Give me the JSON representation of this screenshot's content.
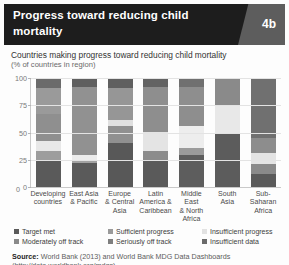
{
  "header": {
    "title": "Progress toward reducing child mortality",
    "badge": "4b"
  },
  "subtitle": {
    "main": "Countries making progress toward reducing child mortality",
    "sub": "(% of countries in region)"
  },
  "source": {
    "label": "Source:",
    "text": " World Bank (2013) and World Bank MDG Data Dashboards",
    "url": "(http://data.worldbank.org/mdgs)."
  },
  "colors": {
    "target_met": "#5a5a5a",
    "sufficient_progress": "#9a9a9a",
    "insufficient_progress": "#e8e8e8",
    "moderately_off_track": "#8a8a8a",
    "seriously_off_track": "#7e7e7e",
    "insufficient_data": "#6b6b6b",
    "header_bg": "#1d1d1d",
    "header_wedge": "#5d5d5d",
    "grid": "#e3e3e3"
  },
  "legend": [
    {
      "label": "Target met",
      "color": "#5a5a5a"
    },
    {
      "label": "Sufficient progress",
      "color": "#9a9a9a"
    },
    {
      "label": "Insufficient progress",
      "color": "#e2e2e2"
    },
    {
      "label": "Moderately off track",
      "color": "#8a8a8a"
    },
    {
      "label": "Seriously off track",
      "color": "#7e7e7e"
    },
    {
      "label": "Insufficient data",
      "color": "#6b6b6b"
    }
  ],
  "chart_data": {
    "type": "bar",
    "subtype": "stacked-bar-100",
    "title": "Countries making progress toward reducing child mortality",
    "xlabel": "",
    "ylabel": "% of countries in region",
    "ylim": [
      0,
      100
    ],
    "yticks": [
      0,
      25,
      50,
      75,
      100
    ],
    "grid": true,
    "legend_position": "bottom",
    "categories": [
      "Developing countries",
      "East Asia & Pacific",
      "Europe & Central Asia",
      "Latin America & Caribbean",
      "Middle East & North Africa",
      "South Asia",
      "Sub-Saharan Africa"
    ],
    "category_lines": [
      [
        "Developing",
        "countries"
      ],
      [
        "East Asia",
        "& Pacific"
      ],
      [
        "Europe",
        "& Central",
        "Asia"
      ],
      [
        "Latin",
        "America &",
        "Caribbean"
      ],
      [
        "Middle East",
        "& North",
        "Africa"
      ],
      [
        "South",
        "Asia"
      ],
      [
        "Sub-Saharan",
        "Africa"
      ]
    ],
    "series": [
      {
        "name": "Target met",
        "color": "#5a5a5a",
        "values": [
          25,
          22,
          40,
          24,
          29,
          50,
          12
        ]
      },
      {
        "name": "Seriously off track",
        "color": "#7e7e7e",
        "values": [
          8,
          3,
          16,
          9,
          7,
          0,
          9
        ]
      },
      {
        "name": "Insufficient progress",
        "color": "#e2e2e2",
        "values": [
          9,
          4,
          5,
          17,
          20,
          25,
          10
        ]
      },
      {
        "name": "Moderately off track",
        "color": "#8a8a8a",
        "values": [
          25,
          0,
          30,
          0,
          0,
          0,
          14
        ]
      },
      {
        "name": "Sufficient progress",
        "color": "#9a9a9a",
        "values": [
          24,
          63,
          0,
          42,
          36,
          25,
          0
        ]
      },
      {
        "name": "Insufficient data",
        "color": "#6b6b6b",
        "values": [
          9,
          8,
          9,
          8,
          8,
          0,
          55
        ]
      }
    ],
    "stacks": [
      {
        "category": "Developing countries",
        "segments": [
          {
            "name": "Insufficient data",
            "value": 9,
            "color": "#6b6b6b"
          },
          {
            "name": "Sufficient progress",
            "value": 24,
            "color": "#9a9a9a"
          },
          {
            "name": "Moderately off track",
            "value": 25,
            "color": "#8f8f8f"
          },
          {
            "name": "Insufficient progress",
            "value": 9,
            "color": "#e8e8e8"
          },
          {
            "name": "Seriously off track",
            "value": 8,
            "color": "#9d9d9d"
          },
          {
            "name": "Target met",
            "value": 25,
            "color": "#5a5a5a"
          }
        ]
      },
      {
        "category": "East Asia & Pacific",
        "segments": [
          {
            "name": "Insufficient data",
            "value": 8,
            "color": "#5f5f5f"
          },
          {
            "name": "Sufficient progress",
            "value": 63,
            "color": "#919191"
          },
          {
            "name": "Insufficient progress",
            "value": 4,
            "color": "#ececec"
          },
          {
            "name": "Seriously off track",
            "value": 3,
            "color": "#a2a2a2"
          },
          {
            "name": "Target met",
            "value": 22,
            "color": "#5a5a5a"
          }
        ]
      },
      {
        "category": "Europe & Central Asia",
        "segments": [
          {
            "name": "Insufficient data",
            "value": 9,
            "color": "#5f5f5f"
          },
          {
            "name": "Moderately off track",
            "value": 30,
            "color": "#969696"
          },
          {
            "name": "Insufficient progress",
            "value": 5,
            "color": "#e0e0e0"
          },
          {
            "name": "Seriously off track",
            "value": 16,
            "color": "#909090"
          },
          {
            "name": "Target met",
            "value": 40,
            "color": "#585858"
          }
        ]
      },
      {
        "category": "Latin America & Caribbean",
        "segments": [
          {
            "name": "Insufficient data",
            "value": 8,
            "color": "#636363"
          },
          {
            "name": "Sufficient progress",
            "value": 42,
            "color": "#8e8e8e"
          },
          {
            "name": "Insufficient progress",
            "value": 17,
            "color": "#e4e4e4"
          },
          {
            "name": "Seriously off track",
            "value": 9,
            "color": "#8c8c8c"
          },
          {
            "name": "Target met",
            "value": 24,
            "color": "#5a5a5a"
          }
        ]
      },
      {
        "category": "Middle East & North Africa",
        "segments": [
          {
            "name": "Insufficient data",
            "value": 8,
            "color": "#707070"
          },
          {
            "name": "Sufficient progress",
            "value": 36,
            "color": "#8e8e8e"
          },
          {
            "name": "Insufficient progress",
            "value": 20,
            "color": "#ededed"
          },
          {
            "name": "Seriously off track",
            "value": 7,
            "color": "#9b9b9b"
          },
          {
            "name": "Target met",
            "value": 29,
            "color": "#5d5d5d"
          }
        ]
      },
      {
        "category": "South Asia",
        "segments": [
          {
            "name": "Sufficient progress",
            "value": 25,
            "color": "#8a8a8a"
          },
          {
            "name": "Insufficient progress",
            "value": 25,
            "color": "#e8e8e8"
          },
          {
            "name": "Target met",
            "value": 50,
            "color": "#5c5c5c"
          }
        ]
      },
      {
        "category": "Sub-Saharan Africa",
        "segments": [
          {
            "name": "Insufficient data",
            "value": 55,
            "color": "#707070"
          },
          {
            "name": "Moderately off track",
            "value": 14,
            "color": "#8d8d8d"
          },
          {
            "name": "Insufficient progress",
            "value": 10,
            "color": "#e4e4e4"
          },
          {
            "name": "Seriously off track",
            "value": 9,
            "color": "#8a8a8a"
          },
          {
            "name": "Target met",
            "value": 12,
            "color": "#5a5a5a"
          }
        ]
      }
    ]
  }
}
